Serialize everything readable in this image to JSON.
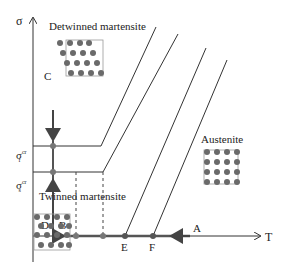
{
  "diagram": {
    "axes": {
      "y_label": "σ",
      "x_label": "T"
    },
    "stress_labels": {
      "sigma_f": "σ",
      "sigma_f_sup": "cr",
      "sigma_f_sub": "f",
      "sigma_s": "σ",
      "sigma_s_sup": "cr",
      "sigma_s_sub": "s"
    },
    "phases": {
      "detwinned": "Detwinned martensite",
      "twinned": "Twinned martensite",
      "austenite": "Austenite"
    },
    "points": {
      "A": "A",
      "B": "B",
      "C": "C",
      "D": "D",
      "E": "E",
      "F": "F"
    },
    "colors": {
      "line": "#333333",
      "path": "#555555",
      "atom": "#6a6a6a"
    }
  }
}
